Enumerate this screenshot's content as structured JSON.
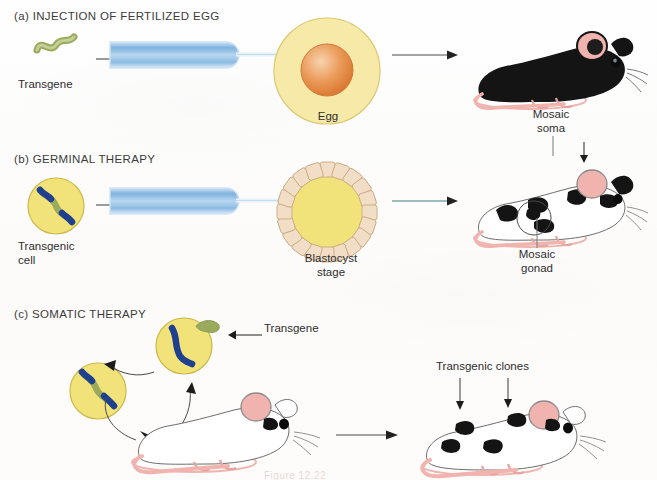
{
  "figure": {
    "background_color": "#fdfcfb",
    "caption_partial": "Figure 12.22"
  },
  "palette": {
    "transgene_green": "#9aab5e",
    "chromosome_blue": "#1f3f8f",
    "cell_yellow": "#f2e27a",
    "cell_yellow_edge": "#cbb94a",
    "egg_cytoplasm": "#f7e9a8",
    "egg_nucleus": "#e8944f",
    "pipette_blue": "#7fb2e0",
    "blastocyst_cell": "#f2ddc6",
    "blastocyst_edge": "#c9a87f",
    "mouse_pink": "#f0b3ae",
    "mouse_black": "#141414",
    "arrow_gray": "#4a4a4a",
    "text_dark": "#2e2e2e"
  },
  "sections": [
    {
      "id": "a",
      "title": "(a)  INJECTION OF FERTILIZED EGG",
      "labels": {
        "transgene": "Transgene",
        "target": "Egg",
        "outcome": "Mosaic\nsoma"
      },
      "mouse_coat": "black"
    },
    {
      "id": "b",
      "title": "(b)  GERMINAL THERAPY",
      "labels": {
        "source_cell": "Transgenic\ncell",
        "target": "Blastocyst\nstage",
        "outcome": "Mosaic\ngonad"
      },
      "mouse_coat": "spotted"
    },
    {
      "id": "c",
      "title": "(c)  SOMATIC THERAPY",
      "labels": {
        "transgene": "Transgene",
        "outcome": "Transgenic clones"
      },
      "mouse_coat": "white-to-spotted"
    }
  ],
  "icons": {
    "arrow": "arrow-right-icon",
    "pipette": "micropipette-icon",
    "egg": "egg-cell-icon",
    "blastocyst": "blastocyst-icon",
    "transgene": "transgene-dna-icon",
    "chromosome": "chromosome-icon",
    "mouse": "mouse-icon"
  }
}
